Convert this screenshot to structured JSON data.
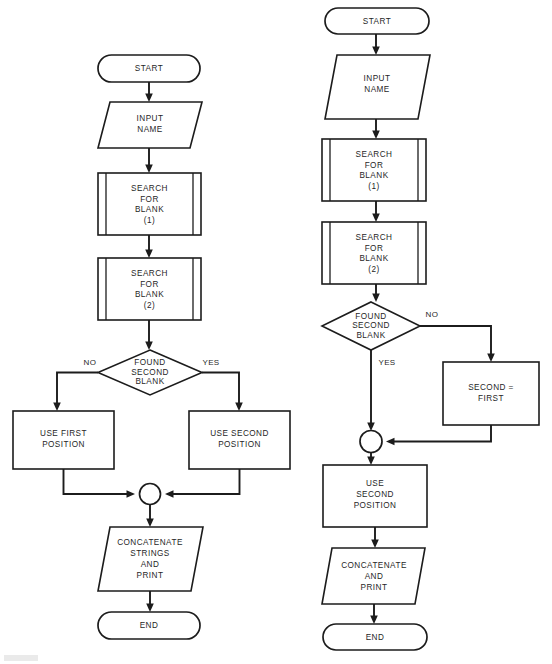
{
  "document": {
    "kind": "flowchart-figure",
    "title": "Name blank-search flowcharts",
    "background_color": "#ffffff",
    "line_color": "#1c1c1c",
    "text_color": "#1f1f1f"
  },
  "charts": [
    {
      "id": "left-flowchart",
      "name": "left-flowchart",
      "nodes": [
        {
          "id": "l-start",
          "type": "terminator",
          "label": "START",
          "lines": [
            "START"
          ]
        },
        {
          "id": "l-input",
          "type": "input-output",
          "label": "INPUT NAME",
          "lines": [
            "INPUT",
            "NAME"
          ]
        },
        {
          "id": "l-search1",
          "type": "predefined-process",
          "label": "SEARCH FOR BLANK (1)",
          "lines": [
            "SEARCH",
            "FOR",
            "BLANK",
            "(1)"
          ]
        },
        {
          "id": "l-search2",
          "type": "predefined-process",
          "label": "SEARCH FOR BLANK (2)",
          "lines": [
            "SEARCH",
            "FOR",
            "BLANK",
            "(2)"
          ]
        },
        {
          "id": "l-decision",
          "type": "decision",
          "label": "FOUND SECOND BLANK",
          "lines": [
            "FOUND",
            "SECOND",
            "BLANK"
          ]
        },
        {
          "id": "l-first",
          "type": "process",
          "label": "USE FIRST POSITION",
          "lines": [
            "USE FIRST",
            "POSITION"
          ]
        },
        {
          "id": "l-second",
          "type": "process",
          "label": "USE SECOND POSITION",
          "lines": [
            "USE SECOND",
            "POSITION"
          ]
        },
        {
          "id": "l-merge",
          "type": "connector",
          "label": "",
          "lines": []
        },
        {
          "id": "l-concat",
          "type": "input-output",
          "label": "CONCATENATE STRINGS AND PRINT",
          "lines": [
            "CONCATENATE",
            "STRINGS",
            "AND",
            "PRINT"
          ]
        },
        {
          "id": "l-end",
          "type": "terminator",
          "label": "END",
          "lines": [
            "END"
          ]
        }
      ],
      "edges": [
        {
          "from": "l-start",
          "to": "l-input",
          "label": ""
        },
        {
          "from": "l-input",
          "to": "l-search1",
          "label": ""
        },
        {
          "from": "l-search1",
          "to": "l-search2",
          "label": ""
        },
        {
          "from": "l-search2",
          "to": "l-decision",
          "label": ""
        },
        {
          "from": "l-decision",
          "to": "l-first",
          "label": "NO"
        },
        {
          "from": "l-decision",
          "to": "l-second",
          "label": "YES"
        },
        {
          "from": "l-first",
          "to": "l-merge",
          "label": ""
        },
        {
          "from": "l-second",
          "to": "l-merge",
          "label": ""
        },
        {
          "from": "l-merge",
          "to": "l-concat",
          "label": ""
        },
        {
          "from": "l-concat",
          "to": "l-end",
          "label": ""
        }
      ],
      "edge_labels": {
        "no": "NO",
        "yes": "YES"
      }
    },
    {
      "id": "right-flowchart",
      "name": "right-flowchart",
      "nodes": [
        {
          "id": "r-start",
          "type": "terminator",
          "label": "START",
          "lines": [
            "START"
          ]
        },
        {
          "id": "r-input",
          "type": "input-output",
          "label": "INPUT NAME",
          "lines": [
            "INPUT",
            "NAME"
          ]
        },
        {
          "id": "r-search1",
          "type": "predefined-process",
          "label": "SEARCH FOR BLANK (1)",
          "lines": [
            "SEARCH",
            "FOR",
            "BLANK",
            "(1)"
          ]
        },
        {
          "id": "r-search2",
          "type": "predefined-process",
          "label": "SEARCH FOR BLANK (2)",
          "lines": [
            "SEARCH",
            "FOR",
            "BLANK",
            "(2)"
          ]
        },
        {
          "id": "r-decision",
          "type": "decision",
          "label": "FOUND SECOND BLANK",
          "lines": [
            "FOUND",
            "SECOND",
            "BLANK"
          ]
        },
        {
          "id": "r-assign",
          "type": "process",
          "label": "SECOND = FIRST",
          "lines": [
            "SECOND  =",
            "FIRST"
          ]
        },
        {
          "id": "r-merge",
          "type": "connector",
          "label": "",
          "lines": []
        },
        {
          "id": "r-second",
          "type": "process",
          "label": "USE SECOND POSITION",
          "lines": [
            "USE",
            "SECOND",
            "POSITION"
          ]
        },
        {
          "id": "r-concat",
          "type": "input-output",
          "label": "CONCATENATE AND PRINT",
          "lines": [
            "CONCATENATE",
            "AND",
            "PRINT"
          ]
        },
        {
          "id": "r-end",
          "type": "terminator",
          "label": "END",
          "lines": [
            "END"
          ]
        }
      ],
      "edges": [
        {
          "from": "r-start",
          "to": "r-input",
          "label": ""
        },
        {
          "from": "r-input",
          "to": "r-search1",
          "label": ""
        },
        {
          "from": "r-search1",
          "to": "r-search2",
          "label": ""
        },
        {
          "from": "r-search2",
          "to": "r-decision",
          "label": ""
        },
        {
          "from": "r-decision",
          "to": "r-assign",
          "label": "NO"
        },
        {
          "from": "r-decision",
          "to": "r-merge",
          "label": "YES"
        },
        {
          "from": "r-assign",
          "to": "r-merge",
          "label": ""
        },
        {
          "from": "r-merge",
          "to": "r-second",
          "label": ""
        },
        {
          "from": "r-second",
          "to": "r-concat",
          "label": ""
        },
        {
          "from": "r-concat",
          "to": "r-end",
          "label": ""
        }
      ],
      "edge_labels": {
        "no": "NO",
        "yes": "YES"
      }
    }
  ],
  "labels": {
    "l_start": "START",
    "l_input_1": "INPUT",
    "l_input_2": "NAME",
    "l_s1_1": "SEARCH",
    "l_s1_2": "FOR",
    "l_s1_3": "BLANK",
    "l_s1_4": "(1)",
    "l_s2_1": "SEARCH",
    "l_s2_2": "FOR",
    "l_s2_3": "BLANK",
    "l_s2_4": "(2)",
    "l_dec_1": "FOUND",
    "l_dec_2": "SECOND",
    "l_dec_3": "BLANK",
    "l_no": "NO",
    "l_yes": "YES",
    "l_first_1": "USE FIRST",
    "l_first_2": "POSITION",
    "l_second_1": "USE SECOND",
    "l_second_2": "POSITION",
    "l_concat_1": "CONCATENATE",
    "l_concat_2": "STRINGS",
    "l_concat_3": "AND",
    "l_concat_4": "PRINT",
    "l_end": "END",
    "r_start": "START",
    "r_input_1": "INPUT",
    "r_input_2": "NAME",
    "r_s1_1": "SEARCH",
    "r_s1_2": "FOR",
    "r_s1_3": "BLANK",
    "r_s1_4": "(1)",
    "r_s2_1": "SEARCH",
    "r_s2_2": "FOR",
    "r_s2_3": "BLANK",
    "r_s2_4": "(2)",
    "r_dec_1": "FOUND",
    "r_dec_2": "SECOND",
    "r_dec_3": "BLANK",
    "r_no": "NO",
    "r_yes": "YES",
    "r_assign_1": "SECOND  =",
    "r_assign_2": "FIRST",
    "r_second_1": "USE",
    "r_second_2": "SECOND",
    "r_second_3": "POSITION",
    "r_concat_1": "CONCATENATE",
    "r_concat_2": "AND",
    "r_concat_3": "PRINT",
    "r_end": "END"
  }
}
